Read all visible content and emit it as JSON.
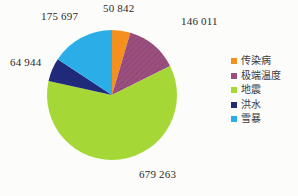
{
  "chart_data": {
    "type": "pie",
    "title": "",
    "xlabel": "",
    "ylabel": "",
    "categories": [
      "传染病",
      "极端温度",
      "地震",
      "洪水",
      "雪暴"
    ],
    "values": [
      50842,
      146011,
      679263,
      64944,
      175697
    ],
    "labels": [
      "50 842",
      "146 011",
      "679 263",
      "64 944",
      "175 697"
    ],
    "colors": [
      "#F5901E",
      "#9B4F7E",
      "#A5D836",
      "#1F2A7A",
      "#2BAEE8"
    ],
    "total": 1116757,
    "start_angle_deg": 0,
    "direction": "clockwise",
    "legend_position": "right",
    "grid": false,
    "background": "#FCFCFA"
  },
  "legend": {
    "items": [
      {
        "label": "传染病",
        "color": "#F5901E"
      },
      {
        "label": "极端温度",
        "color": "#9B4F7E"
      },
      {
        "label": "地震",
        "color": "#A5D836"
      },
      {
        "label": "洪水",
        "color": "#1F2A7A"
      },
      {
        "label": "雪暴",
        "color": "#2BAEE8"
      }
    ]
  }
}
